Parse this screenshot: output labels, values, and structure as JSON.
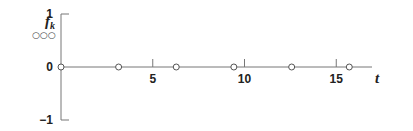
{
  "chart_data": {
    "type": "scatter",
    "title": "",
    "ylabel": "f",
    "ylabel_subscript": "k",
    "legend_marker": "○○○",
    "xlabel": "t",
    "xlim": [
      0,
      17.5
    ],
    "ylim": [
      -1,
      1
    ],
    "x_ticks": [
      5,
      10,
      15
    ],
    "x_tick_labels": [
      "5",
      "10",
      "15"
    ],
    "y_ticks": [
      1,
      0,
      -1
    ],
    "y_tick_labels": [
      "1",
      "0",
      "−1"
    ],
    "grid": false,
    "series": [
      {
        "name": "f_k",
        "marker": "open-circle",
        "x": [
          0,
          3.14,
          6.28,
          9.42,
          12.57,
          15.71
        ],
        "y": [
          0,
          0,
          0,
          0,
          0,
          0
        ]
      }
    ]
  }
}
